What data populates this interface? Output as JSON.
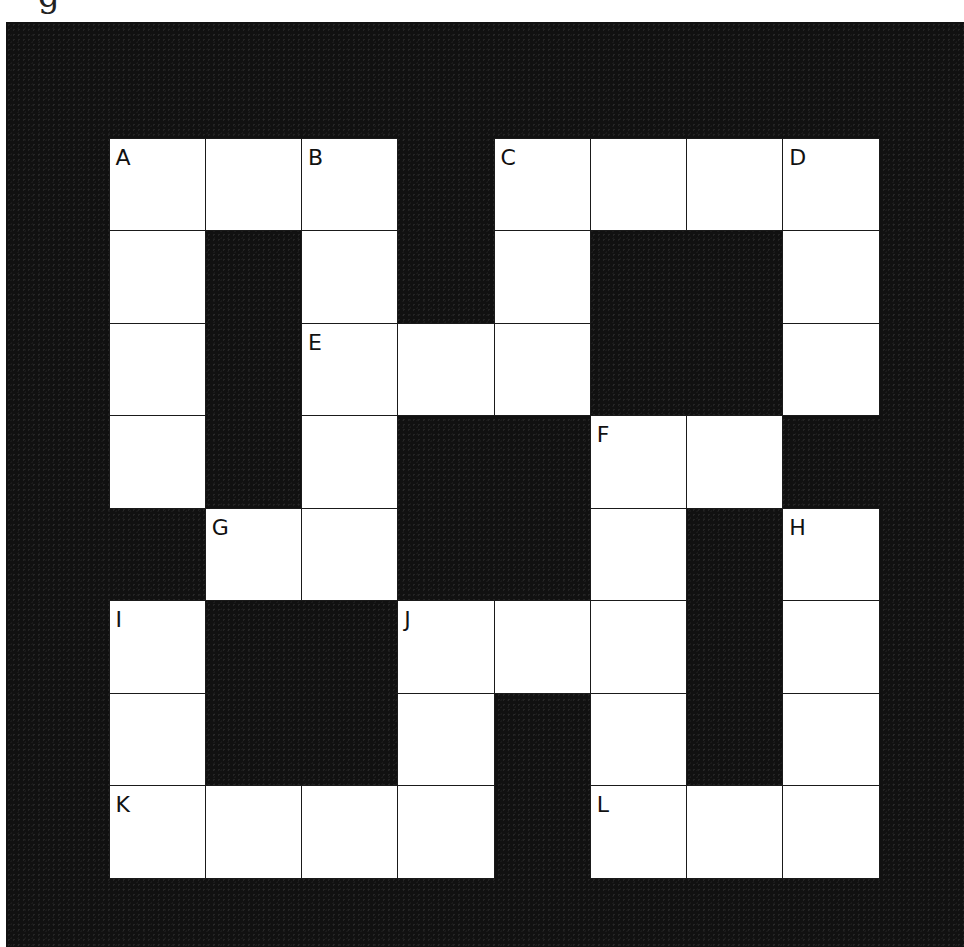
{
  "puzzle": {
    "type": "crossword",
    "header_partial_text": "g",
    "rows": 8,
    "cols": 8,
    "colors": {
      "background": "#111111",
      "cell_white": "#ffffff",
      "grid_line": "#1a1a1a",
      "label": "#111111"
    },
    "layout": [
      [
        1,
        1,
        1,
        0,
        1,
        1,
        1,
        1
      ],
      [
        1,
        0,
        1,
        0,
        1,
        0,
        0,
        1
      ],
      [
        1,
        0,
        1,
        1,
        1,
        0,
        0,
        1
      ],
      [
        1,
        0,
        1,
        0,
        0,
        1,
        1,
        0
      ],
      [
        0,
        1,
        1,
        0,
        0,
        1,
        0,
        1
      ],
      [
        1,
        0,
        0,
        1,
        1,
        1,
        0,
        1
      ],
      [
        1,
        0,
        0,
        1,
        0,
        1,
        0,
        1
      ],
      [
        1,
        1,
        1,
        1,
        0,
        1,
        1,
        1
      ]
    ],
    "labels": [
      {
        "row": 0,
        "col": 0,
        "text": "A"
      },
      {
        "row": 0,
        "col": 2,
        "text": "B"
      },
      {
        "row": 0,
        "col": 4,
        "text": "C"
      },
      {
        "row": 0,
        "col": 7,
        "text": "D"
      },
      {
        "row": 2,
        "col": 2,
        "text": "E"
      },
      {
        "row": 3,
        "col": 5,
        "text": "F"
      },
      {
        "row": 4,
        "col": 1,
        "text": "G"
      },
      {
        "row": 4,
        "col": 7,
        "text": "H"
      },
      {
        "row": 5,
        "col": 0,
        "text": "I"
      },
      {
        "row": 5,
        "col": 3,
        "text": "J"
      },
      {
        "row": 7,
        "col": 0,
        "text": "K"
      },
      {
        "row": 7,
        "col": 5,
        "text": "L"
      }
    ],
    "cell_text": {
      "r0c0": "A",
      "r0c2": "B",
      "r0c4": "C",
      "r0c7": "D",
      "r2c2": "E",
      "r3c5": "F",
      "r4c1": "G",
      "r4c7": "H",
      "r5c0": "I",
      "r5c3": "J",
      "r7c0": "K",
      "r7c5": "L"
    }
  }
}
